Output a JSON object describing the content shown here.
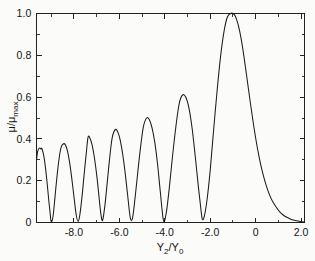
{
  "figure": {
    "background_color": "#fbfbfa",
    "ink_color": "#1b1b1b"
  },
  "chart_data": {
    "type": "line",
    "title": "",
    "subtitle": "",
    "xlabel": "Y2/Y0",
    "xlabel_parts": {
      "base1": "Y",
      "sub1": "2",
      "slash": "/",
      "base2": "Y",
      "sub2": "0"
    },
    "ylabel": "μ/μmax",
    "ylabel_parts": {
      "mu1": "μ",
      "slash": "/",
      "mu2": "μ",
      "sub": "max"
    },
    "xlim": [
      -9.65,
      2.15
    ],
    "ylim": [
      0.0,
      1.0
    ],
    "grid": false,
    "legend": null,
    "xticks": [
      -8.0,
      -6.0,
      -4.0,
      -2.0,
      0.0,
      2.0
    ],
    "xticklabels": [
      "-8.0",
      "-6.0",
      "-4.0",
      "-2.0",
      "0",
      "2.0"
    ],
    "xticks_minor": [
      -9.0,
      -7.0,
      -5.0,
      -3.0,
      -1.0,
      1.0
    ],
    "yticks": [
      0.0,
      0.2,
      0.4,
      0.6,
      0.8,
      1.0
    ],
    "yticklabels": [
      "0",
      "0.2",
      "0.4",
      "0.6",
      "0.8",
      "1.0"
    ],
    "yticks_minor": [
      0.1,
      0.3,
      0.5,
      0.7,
      0.9
    ],
    "peaks": [
      {
        "x": -1.0,
        "y": 1.0
      },
      {
        "x": -3.22,
        "y": 0.61
      },
      {
        "x": -4.8,
        "y": 0.5
      },
      {
        "x": -6.18,
        "y": 0.445
      },
      {
        "x": -7.38,
        "y": 0.408
      },
      {
        "x": -8.46,
        "y": 0.377
      },
      {
        "x": -9.42,
        "y": 0.355
      }
    ],
    "zeros": [
      -2.35,
      -4.06,
      -5.52,
      -6.82,
      -7.98,
      -9.02
    ],
    "series": [
      {
        "name": "mu/mu_max",
        "x": [
          -9.65,
          -9.6,
          -9.55,
          -9.5,
          -9.45,
          -9.42,
          -9.35,
          -9.3,
          -9.25,
          -9.2,
          -9.15,
          -9.1,
          -9.05,
          -9.02,
          -8.98,
          -8.92,
          -8.85,
          -8.8,
          -8.72,
          -8.64,
          -8.56,
          -8.46,
          -8.38,
          -8.3,
          -8.22,
          -8.14,
          -8.06,
          -7.98,
          -7.9,
          -7.82,
          -7.74,
          -7.64,
          -7.54,
          -7.46,
          -7.38,
          -7.3,
          -7.2,
          -7.1,
          -7.0,
          -6.92,
          -6.82,
          -6.74,
          -6.64,
          -6.54,
          -6.44,
          -6.32,
          -6.18,
          -6.06,
          -5.96,
          -5.86,
          -5.76,
          -5.64,
          -5.52,
          -5.42,
          -5.3,
          -5.18,
          -5.06,
          -4.94,
          -4.8,
          -4.68,
          -4.56,
          -4.44,
          -4.32,
          -4.2,
          -4.06,
          -3.94,
          -3.8,
          -3.66,
          -3.5,
          -3.36,
          -3.22,
          -3.08,
          -2.94,
          -2.8,
          -2.66,
          -2.52,
          -2.42,
          -2.35,
          -2.26,
          -2.14,
          -2.0,
          -1.86,
          -1.7,
          -1.55,
          -1.4,
          -1.25,
          -1.1,
          -1.0,
          -0.9,
          -0.78,
          -0.64,
          -0.5,
          -0.36,
          -0.22,
          -0.08,
          0.06,
          0.2,
          0.34,
          0.48,
          0.62,
          0.76,
          0.9,
          1.05,
          1.2,
          1.35,
          1.5,
          1.65,
          1.8,
          1.95,
          2.15
        ],
        "y": [
          0.3,
          0.34,
          0.353,
          0.356,
          0.352,
          0.355,
          0.33,
          0.3,
          0.258,
          0.208,
          0.152,
          0.096,
          0.046,
          0.012,
          0.004,
          0.03,
          0.104,
          0.164,
          0.248,
          0.318,
          0.362,
          0.377,
          0.372,
          0.348,
          0.306,
          0.248,
          0.178,
          0.104,
          0.036,
          0.006,
          0.038,
          0.13,
          0.244,
          0.33,
          0.408,
          0.404,
          0.37,
          0.31,
          0.228,
          0.148,
          0.044,
          0.01,
          0.08,
          0.186,
          0.296,
          0.404,
          0.445,
          0.43,
          0.392,
          0.33,
          0.25,
          0.134,
          0.022,
          0.022,
          0.128,
          0.252,
          0.368,
          0.46,
          0.5,
          0.492,
          0.452,
          0.382,
          0.28,
          0.148,
          0.01,
          0.044,
          0.168,
          0.318,
          0.47,
          0.572,
          0.61,
          0.6,
          0.548,
          0.452,
          0.316,
          0.168,
          0.072,
          0.016,
          0.03,
          0.11,
          0.252,
          0.432,
          0.628,
          0.79,
          0.91,
          0.982,
          1.0,
          1.0,
          0.988,
          0.95,
          0.88,
          0.782,
          0.672,
          0.562,
          0.458,
          0.366,
          0.288,
          0.224,
          0.172,
          0.13,
          0.098,
          0.074,
          0.052,
          0.037,
          0.026,
          0.018,
          0.012,
          0.008,
          0.005,
          0.002
        ]
      }
    ]
  }
}
